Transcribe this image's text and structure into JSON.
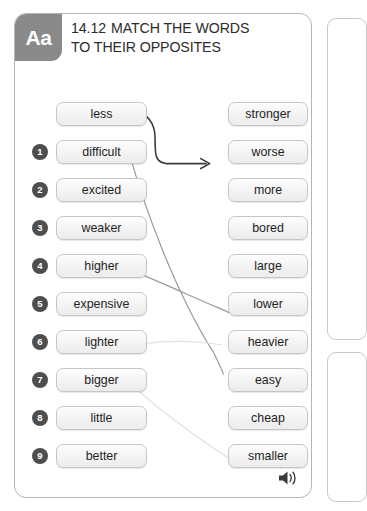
{
  "header": {
    "badge": "Aa",
    "exercise_number": "14.12",
    "title_line1": "MATCH THE WORDS",
    "title_line2": "TO THEIR OPPOSITES"
  },
  "colors": {
    "badge_bg": "#8a8a8a",
    "number_badge_bg": "#4e4e4e",
    "box_border": "#c6c6c6",
    "card_border": "#b5b5b5",
    "arrow_dark": "#3b3b3b",
    "line_gray": "#9a9a9a",
    "line_faint": "#e2e2e2",
    "text": "#1f1f1f"
  },
  "left_column": [
    {
      "number": "",
      "word": "less"
    },
    {
      "number": "1",
      "word": "difficult"
    },
    {
      "number": "2",
      "word": "excited"
    },
    {
      "number": "3",
      "word": "weaker"
    },
    {
      "number": "4",
      "word": "higher"
    },
    {
      "number": "5",
      "word": "expensive"
    },
    {
      "number": "6",
      "word": "lighter"
    },
    {
      "number": "7",
      "word": "bigger"
    },
    {
      "number": "8",
      "word": "little"
    },
    {
      "number": "9",
      "word": "better"
    }
  ],
  "right_column": [
    {
      "word": "stronger"
    },
    {
      "word": "worse"
    },
    {
      "word": "more"
    },
    {
      "word": "bored"
    },
    {
      "word": "large"
    },
    {
      "word": "lower"
    },
    {
      "word": "heavier"
    },
    {
      "word": "easy"
    },
    {
      "word": "cheap"
    },
    {
      "word": "smaller"
    }
  ],
  "connections": [
    {
      "from": "less",
      "to": "more",
      "style": "arrow-dark"
    },
    {
      "from": "difficult",
      "to": "easy",
      "style": "line-gray"
    },
    {
      "from": "higher",
      "to": "lower",
      "style": "line-gray"
    },
    {
      "from": "lighter",
      "to": "heavier",
      "style": "line-faint"
    },
    {
      "from": "bigger",
      "to": "smaller",
      "style": "line-faint"
    }
  ],
  "audio": {
    "icon": "speaker-icon"
  }
}
